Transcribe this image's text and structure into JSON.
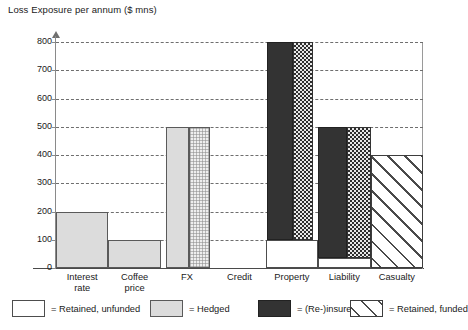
{
  "chart_data": {
    "type": "bar",
    "title": "Loss Exposure per annum ($ mns)",
    "ylabel": "Loss Exposure per annum ($ mns)",
    "xlabel": "",
    "ylim": [
      0,
      800
    ],
    "yticks": [
      0,
      100,
      200,
      300,
      400,
      500,
      600,
      700,
      800
    ],
    "ytick_labels": [
      "0",
      "100",
      "200",
      "300",
      "400",
      "500",
      "600",
      "700",
      "800"
    ],
    "grid": "horizontal-dashed",
    "legend_position": "bottom",
    "categories": [
      "Interest\nrate",
      "Coffee\nprice",
      "FX",
      "Credit",
      "Property",
      "Liability",
      "Casualty"
    ],
    "series": [
      {
        "name": "Retained, unfunded",
        "key": "unfunded",
        "color": "#ffffff",
        "values": [
          0,
          0,
          0,
          0,
          100,
          35,
          0
        ]
      },
      {
        "name": "Hedged",
        "key": "hedged",
        "color": "#dcdcdc",
        "values": [
          200,
          100,
          500,
          0,
          0,
          0,
          0
        ]
      },
      {
        "name": "(Re-)insured",
        "key": "insured",
        "color": "#333333",
        "values": [
          0,
          0,
          0,
          0,
          700,
          465,
          0
        ]
      },
      {
        "name": "Retained, funded",
        "key": "funded",
        "color": "#ffffff",
        "values": [
          0,
          0,
          0,
          0,
          0,
          0,
          400
        ]
      }
    ],
    "bars": [
      {
        "category": "Interest\nrate",
        "label": "Interest rate",
        "segments": [
          {
            "series": "Hedged",
            "fill": "hedged",
            "from": 0,
            "to": 200,
            "x": 0,
            "w": 100
          }
        ]
      },
      {
        "category": "Coffee\nprice",
        "label": "Coffee price",
        "segments": [
          {
            "series": "Hedged",
            "fill": "hedged",
            "from": 0,
            "to": 100,
            "x": 0,
            "w": 100
          }
        ]
      },
      {
        "category": "FX",
        "label": "FX",
        "segments": [
          {
            "series": "Hedged",
            "fill": "hedged",
            "from": 0,
            "to": 500,
            "x": 10,
            "w": 43
          },
          {
            "series": "Hedged",
            "fill": "hedged-light",
            "from": 0,
            "to": 500,
            "x": 53,
            "w": 40
          }
        ]
      },
      {
        "category": "Credit",
        "label": "Credit",
        "segments": []
      },
      {
        "category": "Property",
        "label": "Property",
        "segments": [
          {
            "series": "Retained, unfunded",
            "fill": "unfunded",
            "from": 0,
            "to": 100,
            "x": 0,
            "w": 100
          },
          {
            "series": "(Re-)insured",
            "fill": "insured",
            "from": 100,
            "to": 800,
            "x": 3,
            "w": 49
          },
          {
            "series": "(Re-)insured",
            "fill": "insured-check",
            "from": 100,
            "to": 800,
            "x": 52,
            "w": 38
          }
        ]
      },
      {
        "category": "Liability",
        "label": "Liability",
        "segments": [
          {
            "series": "Retained, unfunded",
            "fill": "unfunded",
            "from": 0,
            "to": 35,
            "x": 0,
            "w": 100
          },
          {
            "series": "(Re-)insured",
            "fill": "insured",
            "from": 35,
            "to": 500,
            "x": 0,
            "w": 55
          },
          {
            "series": "(Re-)insured",
            "fill": "insured-check",
            "from": 35,
            "to": 500,
            "x": 55,
            "w": 45
          }
        ]
      },
      {
        "category": "Casualty",
        "label": "Casualty",
        "segments": [
          {
            "series": "Retained, funded",
            "fill": "funded",
            "from": 0,
            "to": 400,
            "x": 0,
            "w": 100
          }
        ]
      }
    ]
  },
  "legend": {
    "items": [
      {
        "label": "= Retained, unfunded",
        "fill": "unfunded"
      },
      {
        "label": "= Hedged",
        "fill": "hedged"
      },
      {
        "label": "= (Re-)insured",
        "fill": "insured"
      },
      {
        "label": "= Retained, funded",
        "fill": "funded"
      }
    ]
  }
}
